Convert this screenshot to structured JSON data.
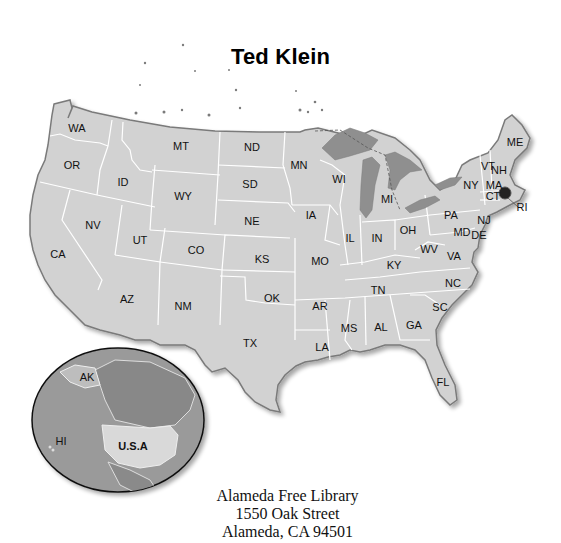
{
  "title": "Ted Klein",
  "map": {
    "land_color": "#d2d2d2",
    "border_color": "#ffffff",
    "coast_color": "#7a7a7a",
    "water_color": "#8f8f8f",
    "states": [
      {
        "abbr": "WA",
        "x": 77,
        "y": 129
      },
      {
        "abbr": "OR",
        "x": 72,
        "y": 166
      },
      {
        "abbr": "ID",
        "x": 123,
        "y": 183
      },
      {
        "abbr": "MT",
        "x": 181,
        "y": 147
      },
      {
        "abbr": "WY",
        "x": 183,
        "y": 197
      },
      {
        "abbr": "ND",
        "x": 252,
        "y": 148
      },
      {
        "abbr": "SD",
        "x": 250,
        "y": 185
      },
      {
        "abbr": "NE",
        "x": 252,
        "y": 222
      },
      {
        "abbr": "MN",
        "x": 299,
        "y": 166
      },
      {
        "abbr": "WI",
        "x": 339,
        "y": 180
      },
      {
        "abbr": "MI",
        "x": 387,
        "y": 200
      },
      {
        "abbr": "IA",
        "x": 311,
        "y": 216
      },
      {
        "abbr": "IL",
        "x": 350,
        "y": 239
      },
      {
        "abbr": "IN",
        "x": 377,
        "y": 239
      },
      {
        "abbr": "OH",
        "x": 408,
        "y": 231
      },
      {
        "abbr": "PA",
        "x": 451,
        "y": 216
      },
      {
        "abbr": "NY",
        "x": 471,
        "y": 186
      },
      {
        "abbr": "ME",
        "x": 515,
        "y": 143
      },
      {
        "abbr": "VT",
        "x": 488,
        "y": 167
      },
      {
        "abbr": "NH",
        "x": 499,
        "y": 171
      },
      {
        "abbr": "MA",
        "x": 494,
        "y": 186
      },
      {
        "abbr": "CT",
        "x": 493,
        "y": 197
      },
      {
        "abbr": "RI",
        "x": 522,
        "y": 208
      },
      {
        "abbr": "NJ",
        "x": 484,
        "y": 221
      },
      {
        "abbr": "MD",
        "x": 462,
        "y": 233
      },
      {
        "abbr": "DE",
        "x": 479,
        "y": 236
      },
      {
        "abbr": "WV",
        "x": 429,
        "y": 250
      },
      {
        "abbr": "VA",
        "x": 454,
        "y": 257
      },
      {
        "abbr": "KY",
        "x": 394,
        "y": 266
      },
      {
        "abbr": "NC",
        "x": 453,
        "y": 284
      },
      {
        "abbr": "TN",
        "x": 378,
        "y": 291
      },
      {
        "abbr": "SC",
        "x": 440,
        "y": 308
      },
      {
        "abbr": "GA",
        "x": 414,
        "y": 326
      },
      {
        "abbr": "AL",
        "x": 381,
        "y": 328
      },
      {
        "abbr": "MS",
        "x": 349,
        "y": 329
      },
      {
        "abbr": "LA",
        "x": 322,
        "y": 348
      },
      {
        "abbr": "AR",
        "x": 320,
        "y": 307
      },
      {
        "abbr": "MO",
        "x": 320,
        "y": 262
      },
      {
        "abbr": "KS",
        "x": 262,
        "y": 260
      },
      {
        "abbr": "OK",
        "x": 272,
        "y": 299
      },
      {
        "abbr": "TX",
        "x": 250,
        "y": 344
      },
      {
        "abbr": "NM",
        "x": 183,
        "y": 307
      },
      {
        "abbr": "AZ",
        "x": 127,
        "y": 300
      },
      {
        "abbr": "CO",
        "x": 196,
        "y": 251
      },
      {
        "abbr": "UT",
        "x": 140,
        "y": 241
      },
      {
        "abbr": "NV",
        "x": 93,
        "y": 226
      },
      {
        "abbr": "CA",
        "x": 58,
        "y": 255
      },
      {
        "abbr": "FL",
        "x": 443,
        "y": 383
      }
    ]
  },
  "inset": {
    "labels": [
      {
        "text": "AK",
        "x": 87,
        "y": 378
      },
      {
        "text": "HI",
        "x": 61,
        "y": 442
      },
      {
        "text": "U.S.A",
        "x": 133,
        "y": 447
      }
    ]
  },
  "address": {
    "line1": "Alameda Free Library",
    "line2": "1550 Oak Street",
    "line3": "Alameda, CA 94501"
  }
}
